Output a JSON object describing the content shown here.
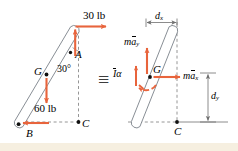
{
  "figure": {
    "background_color": "#ffffff",
    "strip_color": "#f6efe0",
    "force_color": "#e8643c",
    "rod_color": "#6b7280",
    "dash_color": "#8a8a8a",
    "equivalence_symbol": "≡"
  },
  "left_diagram": {
    "name": "free-body-diagram",
    "labels": {
      "force_top": "30 lb",
      "point_a": "A",
      "point_b": "B",
      "point_c": "C",
      "point_g": "G",
      "angle": "30°",
      "weight": "60 lb"
    },
    "forces": [
      {
        "name": "applied-horizontal-force",
        "label": "30 lb",
        "magnitude": 30,
        "unit": "lb",
        "direction": "right",
        "at": "A"
      },
      {
        "name": "reaction-at-a",
        "label": "",
        "direction": "up",
        "at": "A"
      },
      {
        "name": "weight-force",
        "label": "60 lb",
        "magnitude": 60,
        "unit": "lb",
        "direction": "down",
        "at": "G"
      },
      {
        "name": "reaction-at-b",
        "label": "",
        "direction": "left",
        "at": "B"
      }
    ]
  },
  "right_diagram": {
    "name": "kinetic-diagram",
    "labels": {
      "point_g": "G",
      "point_c": "C",
      "dim_x": "d",
      "dim_x_sub": "x",
      "dim_y": "d",
      "dim_y_sub": "y",
      "inertia_moment": "I",
      "inertia_moment_sym": "α",
      "ma_x_head": "m",
      "ma_x_a": "a",
      "ma_x_sub": "x",
      "ma_y_head": "m",
      "ma_y_a": "a",
      "ma_y_sub": "y"
    },
    "vectors": [
      {
        "name": "ma-x-vector",
        "label": "ma_x",
        "direction": "right",
        "at": "G"
      },
      {
        "name": "ma-y-vector",
        "label": "ma_y",
        "direction": "up",
        "at": "G"
      },
      {
        "name": "i-alpha-couple",
        "label": "Iα",
        "direction": "counterclockwise",
        "at": "G"
      }
    ],
    "dimensions": [
      {
        "name": "dimension-dx",
        "label": "d_x",
        "orientation": "horizontal"
      },
      {
        "name": "dimension-dy",
        "label": "d_y",
        "orientation": "vertical"
      }
    ]
  }
}
